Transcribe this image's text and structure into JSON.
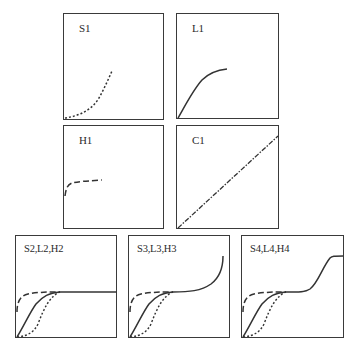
{
  "figure": {
    "legend_styles": {
      "S": "short-dotted line (sigmoidal)",
      "L": "solid line (Langmuir-type)",
      "H": "long-dashed line (high-affinity)",
      "C": "dash-dot line (constant partition)"
    },
    "stroke_color": "#333333"
  },
  "panels": [
    {
      "id": "S1",
      "label": "S1"
    },
    {
      "id": "L1",
      "label": "L1"
    },
    {
      "id": "H1",
      "label": "H1"
    },
    {
      "id": "C1",
      "label": "C1"
    },
    {
      "id": "SLH2",
      "label": "S2,L2,H2"
    },
    {
      "id": "SLH3",
      "label": "S3,L3,H3"
    },
    {
      "id": "SLH4",
      "label": "S4,L4,H4"
    }
  ]
}
